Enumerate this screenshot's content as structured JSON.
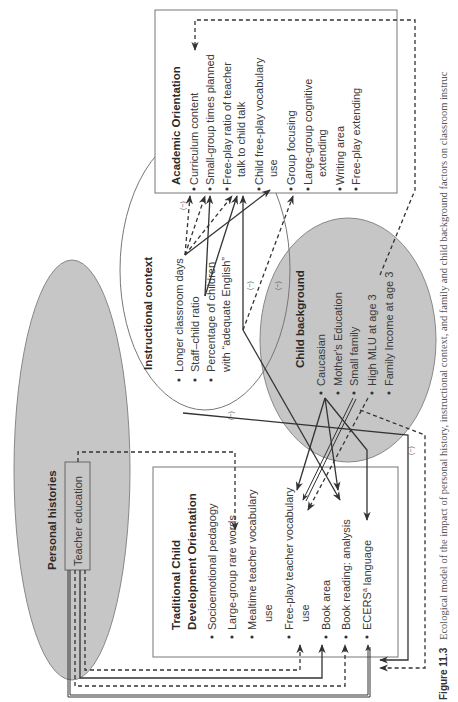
{
  "figure": {
    "label": "Figure 11.3",
    "caption": "Ecological model of the impact of personal history, instructional context, and family and child background factors on classroom instruc"
  },
  "academic_orientation": {
    "title": "Academic Orientation",
    "items": [
      "Curriculum content",
      "Small-group times planned",
      "Free-play ratio of teacher",
      "talk to child talk",
      "Child free-play vocabulary",
      "use",
      "Group focusing",
      "Large-group cognitive",
      "extending",
      "Writing area",
      "Free-play extending"
    ]
  },
  "instructional_context": {
    "title": "Instructional context",
    "items": [
      "Longer classroom days",
      "Staff–child ratio",
      "Percentage of children",
      "with “adequate English”"
    ]
  },
  "child_background": {
    "title": "Child background",
    "items": [
      "Caucasian",
      "Mother's Education",
      "Small family",
      "High MLU at age 3",
      "Family Income at age 3"
    ]
  },
  "personal_histories": {
    "title": "Personal histories",
    "teacher_education": "Teacher education"
  },
  "traditional_orientation": {
    "title_line1": "Traditional Child",
    "title_line2": "Development Orientation",
    "items": [
      "Socioemotional pedagogy",
      "Large-group rare words",
      "Mealtime teacher vocabulary",
      "use",
      "Free-play teacher vocabulary",
      "use",
      "Book area",
      "Book reading: analysis",
      "ECERS",
      "language"
    ],
    "ecers_superscript": "a"
  },
  "negative_label": "(−)",
  "colors": {
    "grey_fill": "#c6c6c6",
    "line": "#333333",
    "box_border": "#777777"
  }
}
